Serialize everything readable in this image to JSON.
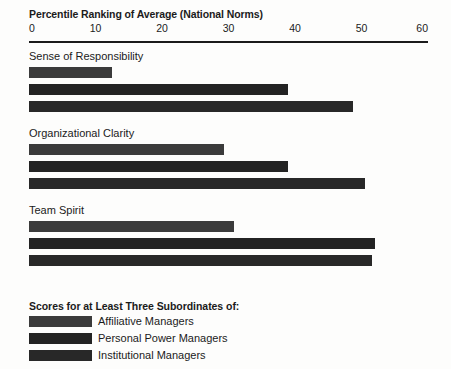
{
  "chart_data": {
    "type": "bar",
    "orientation": "horizontal",
    "title": "Percentile Ranking of Average (National Norms)",
    "xlabel": "",
    "ylabel": "",
    "xlim": [
      0,
      60
    ],
    "xticks": [
      0,
      10,
      20,
      30,
      40,
      50,
      60
    ],
    "xtick_labels": [
      "0",
      "10",
      "20",
      "30",
      "40",
      "50",
      "60"
    ],
    "grid": false,
    "legend_position": "bottom-left",
    "legend_title": "Scores for at Least Three Subordinates of:",
    "categories": [
      "Sense of Responsibility",
      "Organizational Clarity",
      "Team Spirit"
    ],
    "series": [
      {
        "name": "Affiliative Managers",
        "color": "#3b3b3b",
        "values": [
          12.5,
          29.3,
          30.8
        ]
      },
      {
        "name": "Personal Power Managers",
        "color": "#232323",
        "values": [
          39.0,
          39.0,
          52.0
        ]
      },
      {
        "name": "Institutional Managers",
        "color": "#282828",
        "values": [
          48.7,
          50.5,
          51.6
        ]
      }
    ]
  },
  "axis": {
    "ticks": [
      {
        "label": "0",
        "value": 0
      },
      {
        "label": "10",
        "value": 10
      },
      {
        "label": "20",
        "value": 20
      },
      {
        "label": "30",
        "value": 30
      },
      {
        "label": "40",
        "value": 40
      },
      {
        "label": "50",
        "value": 50
      },
      {
        "label": "60",
        "value": 60
      }
    ]
  },
  "groups": [
    {
      "label": "Sense of Responsibility",
      "bars": [
        {
          "series": "Affiliative Managers",
          "value": 12.5,
          "color": "#3b3b3b"
        },
        {
          "series": "Personal Power Managers",
          "value": 39.0,
          "color": "#232323"
        },
        {
          "series": "Institutional Managers",
          "value": 48.7,
          "color": "#282828"
        }
      ]
    },
    {
      "label": "Organizational Clarity",
      "bars": [
        {
          "series": "Affiliative Managers",
          "value": 29.3,
          "color": "#3b3b3b"
        },
        {
          "series": "Personal Power Managers",
          "value": 39.0,
          "color": "#232323"
        },
        {
          "series": "Institutional Managers",
          "value": 50.5,
          "color": "#282828"
        }
      ]
    },
    {
      "label": "Team Spirit",
      "bars": [
        {
          "series": "Affiliative Managers",
          "value": 30.8,
          "color": "#3b3b3b"
        },
        {
          "series": "Personal Power Managers",
          "value": 52.0,
          "color": "#232323"
        },
        {
          "series": "Institutional Managers",
          "value": 51.6,
          "color": "#282828"
        }
      ]
    }
  ],
  "legend": {
    "title": "Scores for at Least Three Subordinates of:",
    "items": [
      {
        "label": "Affiliative Managers",
        "color": "#3b3b3b"
      },
      {
        "label": "Personal Power Managers",
        "color": "#232323"
      },
      {
        "label": "Institutional Managers",
        "color": "#282828"
      }
    ]
  },
  "colors": {
    "text": "#1b1b1b",
    "axis_line": "#1b1b1b",
    "background": "#fdfdfc"
  }
}
